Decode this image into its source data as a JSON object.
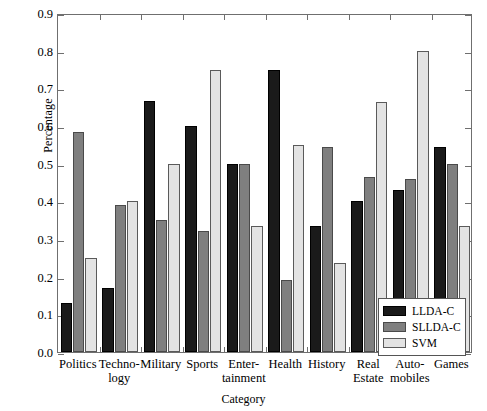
{
  "chart_data": {
    "type": "bar",
    "title": "",
    "xlabel": "Category",
    "ylabel": "Percentage",
    "ylim": [
      0.0,
      0.9
    ],
    "yticks": [
      "0.0",
      "0.1",
      "0.2",
      "0.3",
      "0.4",
      "0.5",
      "0.6",
      "0.7",
      "0.8",
      "0.9"
    ],
    "ytick_values": [
      0.0,
      0.1,
      0.2,
      0.3,
      0.4,
      0.5,
      0.6,
      0.7,
      0.8,
      0.9
    ],
    "grid": false,
    "legend_position": "lower-right",
    "categories": [
      "Politics",
      "Techno-\nlogy",
      "Military",
      "Sports",
      "Enter-\ntainment",
      "Health",
      "History",
      "Real\nEstate",
      "Auto-\nmobiles",
      "Games"
    ],
    "series": [
      {
        "name": "LLDA-C",
        "color": "#1a1a1a",
        "values": [
          0.13,
          0.17,
          0.667,
          0.6,
          0.5,
          0.75,
          0.335,
          0.4,
          0.43,
          0.545
        ]
      },
      {
        "name": "SLLDA-C",
        "color": "#7f7f7f",
        "values": [
          0.585,
          0.39,
          0.35,
          0.32,
          0.5,
          0.19,
          0.545,
          0.465,
          0.46,
          0.5
        ]
      },
      {
        "name": "SVM",
        "color": "#e3e3e3",
        "values": [
          0.25,
          0.4,
          0.5,
          0.75,
          0.335,
          0.55,
          0.235,
          0.665,
          0.8,
          0.335
        ]
      }
    ]
  }
}
